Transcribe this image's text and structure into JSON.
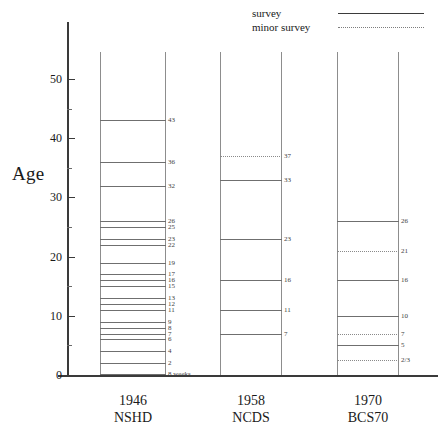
{
  "chart_data": {
    "type": "table",
    "title": "",
    "xlabel": "",
    "ylabel": "Age",
    "ylim": [
      0,
      55
    ],
    "y_ticks_major": [
      0,
      10,
      20,
      30,
      40,
      50
    ],
    "y_ticks_minor": [
      5,
      15,
      25,
      35,
      45
    ],
    "grid": false,
    "legend_position": "top-right",
    "legend": [
      {
        "label": "survey",
        "style": "solid"
      },
      {
        "label": "minor survey",
        "style": "dotted"
      }
    ],
    "categories": [
      "1946 NSHD",
      "1958 NCDS",
      "1970 BCS70"
    ],
    "series": [
      {
        "name": "1946 NSHD",
        "year": "1946",
        "cohort": "NSHD",
        "sweeps": [
          {
            "age": 43,
            "label": "43",
            "style": "solid"
          },
          {
            "age": 36,
            "label": "36",
            "style": "solid"
          },
          {
            "age": 32,
            "label": "32",
            "style": "solid"
          },
          {
            "age": 26,
            "label": "26",
            "style": "solid"
          },
          {
            "age": 25,
            "label": "25",
            "style": "solid"
          },
          {
            "age": 23,
            "label": "23",
            "style": "solid"
          },
          {
            "age": 22,
            "label": "22",
            "style": "solid"
          },
          {
            "age": 19,
            "label": "19",
            "style": "solid"
          },
          {
            "age": 17,
            "label": "17",
            "style": "solid"
          },
          {
            "age": 16,
            "label": "16",
            "style": "solid"
          },
          {
            "age": 15,
            "label": "15",
            "style": "solid"
          },
          {
            "age": 13,
            "label": "13",
            "style": "solid"
          },
          {
            "age": 12,
            "label": "12",
            "style": "solid"
          },
          {
            "age": 11,
            "label": "11",
            "style": "solid"
          },
          {
            "age": 9,
            "label": "9",
            "style": "solid"
          },
          {
            "age": 8,
            "label": "8",
            "style": "solid"
          },
          {
            "age": 7,
            "label": "7",
            "style": "solid"
          },
          {
            "age": 6,
            "label": "6",
            "style": "solid"
          },
          {
            "age": 4,
            "label": "4",
            "style": "solid"
          },
          {
            "age": 2,
            "label": "2",
            "style": "solid"
          },
          {
            "age": 0.15,
            "label": "8 weeks",
            "style": "solid"
          }
        ]
      },
      {
        "name": "1958 NCDS",
        "year": "1958",
        "cohort": "NCDS",
        "sweeps": [
          {
            "age": 37,
            "label": "37",
            "style": "dotted"
          },
          {
            "age": 33,
            "label": "33",
            "style": "solid"
          },
          {
            "age": 23,
            "label": "23",
            "style": "solid"
          },
          {
            "age": 16,
            "label": "16",
            "style": "solid"
          },
          {
            "age": 11,
            "label": "11",
            "style": "solid"
          },
          {
            "age": 7,
            "label": "7",
            "style": "solid"
          }
        ]
      },
      {
        "name": "1970 BCS70",
        "year": "1970",
        "cohort": "BCS70",
        "sweeps": [
          {
            "age": 26,
            "label": "26",
            "style": "solid"
          },
          {
            "age": 21,
            "label": "21",
            "style": "dotted"
          },
          {
            "age": 16,
            "label": "16",
            "style": "solid"
          },
          {
            "age": 10,
            "label": "10",
            "style": "solid"
          },
          {
            "age": 7,
            "label": "7",
            "style": "dotted"
          },
          {
            "age": 5,
            "label": "5",
            "style": "solid"
          },
          {
            "age": 2.5,
            "label": "2/3",
            "style": "dotted"
          }
        ]
      }
    ]
  },
  "colors": {
    "axis": "#3a3a3a",
    "rail": "#8d8d8d",
    "survey_line": "#6f6f6f",
    "minor_line": "#8a8a8a",
    "text": "#1a1a1a",
    "background": "#ffffff"
  }
}
